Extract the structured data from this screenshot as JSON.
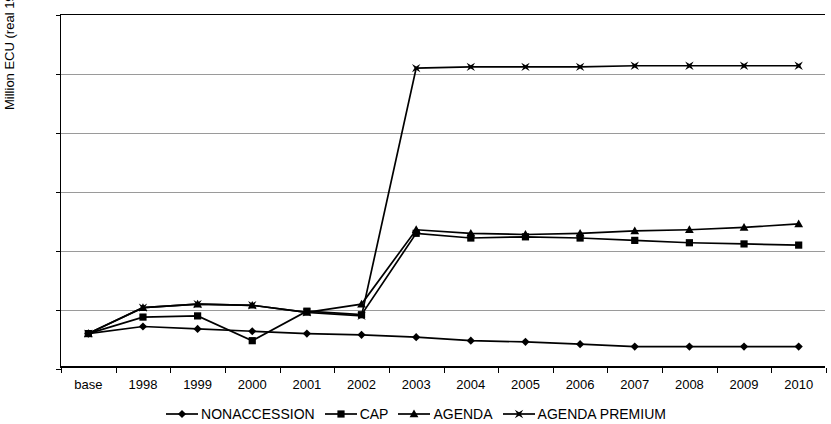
{
  "chart_data": {
    "type": "line",
    "title": "",
    "xlabel": "",
    "ylabel": "Million ECU (real 1996)",
    "categories": [
      "base",
      "1998",
      "1999",
      "2000",
      "2001",
      "2002",
      "2003",
      "2004",
      "2005",
      "2006",
      "2007",
      "2008",
      "2009",
      "2010"
    ],
    "ylim": [
      -100,
      200
    ],
    "yticks": [
      -100,
      -50,
      0,
      50,
      100,
      150,
      200
    ],
    "ytick_labels": [
      "-100",
      "-50",
      "0",
      "50",
      "100",
      "150",
      "200"
    ],
    "grid": true,
    "legend_position": "bottom",
    "series": [
      {
        "name": "NONACCESSION",
        "marker": "diamond",
        "color": "#000000",
        "values": [
          -70,
          -64,
          -66,
          -68,
          -70,
          -71,
          -73,
          -76,
          -77,
          -79,
          -81,
          -81,
          -81,
          -81
        ]
      },
      {
        "name": "CAP",
        "marker": "square",
        "color": "#000000",
        "values": [
          -70,
          -56,
          -55,
          -76,
          -51,
          -54,
          15,
          11,
          12,
          11,
          9,
          7,
          6,
          5
        ]
      },
      {
        "name": "AGENDA",
        "marker": "triangle",
        "color": "#000000",
        "values": [
          -70,
          -48,
          -45,
          -46,
          -52,
          -45,
          18,
          15,
          14,
          15,
          17,
          18,
          20,
          23
        ]
      },
      {
        "name": "AGENDA PREMIUM",
        "marker": "star",
        "color": "#000000",
        "values": [
          -70,
          -48,
          -45,
          -46,
          -52,
          -55,
          155,
          156,
          156,
          156,
          157,
          157,
          157,
          157
        ]
      }
    ]
  },
  "legend": {
    "items": [
      {
        "label": "NONACCESSION",
        "marker": "diamond"
      },
      {
        "label": "CAP",
        "marker": "square"
      },
      {
        "label": "AGENDA",
        "marker": "triangle"
      },
      {
        "label": "AGENDA PREMIUM",
        "marker": "star"
      }
    ]
  },
  "axis": {
    "y_title": "Million ECU (real 1996)"
  }
}
